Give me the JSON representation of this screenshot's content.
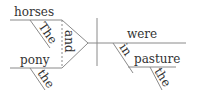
{
  "diagram": {
    "type": "sentence-diagram",
    "subjects": [
      {
        "word": "horses",
        "modifier": "The"
      },
      {
        "word": "pony",
        "modifier": "the"
      }
    ],
    "conjunction": "and",
    "verb": "were",
    "prepositional_phrase": {
      "preposition": "in",
      "object": "pasture",
      "object_modifier": "the"
    },
    "line_color": "#8a8a8a",
    "text_color": "#333333"
  }
}
